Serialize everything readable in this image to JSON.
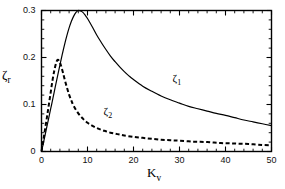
{
  "chart_data": {
    "type": "line",
    "title": "",
    "subtitle": "",
    "xlabel": "K_v",
    "ylabel": "zeta_r",
    "xlabel_base": "K",
    "xlabel_sub": "v",
    "ylabel_base": "ζ",
    "ylabel_sub": "r",
    "xlim": [
      0,
      50
    ],
    "ylim": [
      0,
      0.3
    ],
    "xticks": [
      0,
      10,
      20,
      30,
      40,
      50
    ],
    "xtick_labels": [
      "0",
      "10",
      "20",
      "30",
      "40",
      "50"
    ],
    "yticks": [
      0,
      0.1,
      0.2,
      0.3
    ],
    "ytick_labels": [
      "0",
      "0.1",
      "0.2",
      "0.3"
    ],
    "x_minor_step": 2,
    "y_minor_step": 0.02,
    "grid": false,
    "legend_position": "inline-annotations",
    "tick_direction": "in",
    "frame": "box",
    "series": [
      {
        "name": "ζ₁",
        "label_base": "ζ",
        "label_sub": "1",
        "style": "solid",
        "color": "#000000",
        "width": 1.2,
        "annotation_x": 28.5,
        "annotation_y": 0.152,
        "peak_x": 8.0,
        "peak_y": 0.3,
        "end_y": 0.055,
        "x": [
          0,
          0.5,
          1,
          1.5,
          2,
          2.5,
          3,
          3.5,
          4,
          4.5,
          5,
          5.5,
          6,
          6.5,
          7,
          7.5,
          8,
          8.5,
          9,
          9.5,
          10,
          11,
          12,
          13,
          14,
          15,
          16,
          17,
          18,
          19,
          20,
          22,
          24,
          26,
          28,
          30,
          32,
          34,
          36,
          38,
          40,
          42,
          44,
          46,
          48,
          50
        ],
        "y": [
          0,
          0.022,
          0.045,
          0.068,
          0.091,
          0.114,
          0.138,
          0.161,
          0.184,
          0.206,
          0.227,
          0.246,
          0.263,
          0.277,
          0.288,
          0.296,
          0.3,
          0.299,
          0.296,
          0.29,
          0.283,
          0.266,
          0.248,
          0.232,
          0.217,
          0.203,
          0.191,
          0.18,
          0.17,
          0.161,
          0.153,
          0.139,
          0.128,
          0.118,
          0.11,
          0.103,
          0.096,
          0.091,
          0.086,
          0.081,
          0.077,
          0.072,
          0.067,
          0.063,
          0.059,
          0.055
        ]
      },
      {
        "name": "ζ₂",
        "label_base": "ζ",
        "label_sub": "2",
        "style": "dashed",
        "color": "#000000",
        "width": 2.0,
        "dash_pattern": "4,2.5",
        "annotation_x": 13.5,
        "annotation_y": 0.081,
        "peak_x": 3.5,
        "peak_y": 0.195,
        "end_y": 0.013,
        "x": [
          0,
          0.4,
          0.8,
          1.2,
          1.6,
          2,
          2.4,
          2.8,
          3.2,
          3.5,
          3.8,
          4.2,
          4.6,
          5,
          5.5,
          6,
          6.5,
          7,
          8,
          9,
          10,
          11,
          12,
          13,
          14,
          15,
          16,
          17,
          18,
          20,
          22,
          24,
          26,
          28,
          30,
          33,
          36,
          39,
          42,
          45,
          48,
          50
        ],
        "y": [
          0,
          0.024,
          0.049,
          0.074,
          0.1,
          0.126,
          0.152,
          0.173,
          0.189,
          0.195,
          0.193,
          0.184,
          0.17,
          0.155,
          0.137,
          0.121,
          0.108,
          0.097,
          0.081,
          0.07,
          0.061,
          0.055,
          0.05,
          0.046,
          0.043,
          0.04,
          0.038,
          0.036,
          0.034,
          0.031,
          0.029,
          0.027,
          0.025,
          0.024,
          0.023,
          0.021,
          0.02,
          0.018,
          0.017,
          0.016,
          0.014,
          0.013
        ]
      }
    ]
  },
  "axes": {
    "x_title_base": "K",
    "x_title_sub": "v",
    "y_title_base": "ζ",
    "y_title_sub": "r"
  }
}
